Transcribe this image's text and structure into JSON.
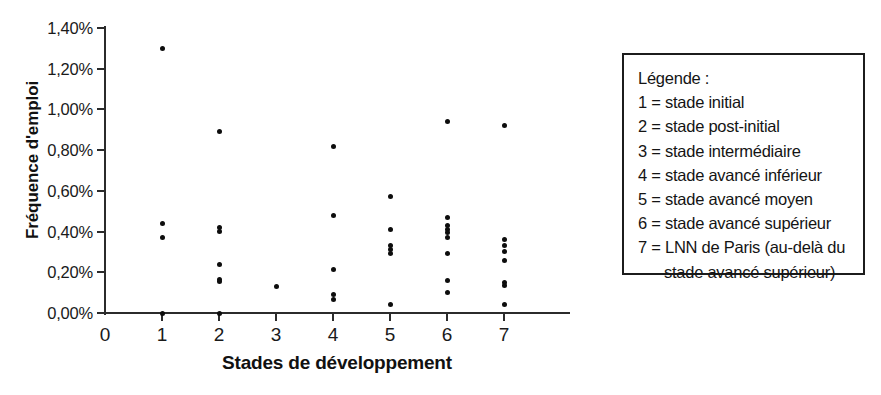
{
  "chart_data": {
    "type": "scatter",
    "title": "",
    "xlabel": "Stades de développement",
    "ylabel": "Fréquence d'emploi",
    "xlim": [
      0,
      8
    ],
    "ylim": [
      0,
      1.4
    ],
    "grid": false,
    "legend_position": "right",
    "x_tick_labels": [
      "0",
      "1",
      "2",
      "3",
      "4",
      "5",
      "6",
      "7"
    ],
    "x_tick_values": [
      0,
      1,
      2,
      3,
      4,
      5,
      6,
      7
    ],
    "y_tick_labels": [
      "0,00%",
      "0,20%",
      "0,40%",
      "0,60%",
      "0,80%",
      "1,00%",
      "1,20%",
      "1,40%"
    ],
    "y_tick_values": [
      0.0,
      0.2,
      0.4,
      0.6,
      0.8,
      1.0,
      1.2,
      1.4
    ],
    "y_unit": "%",
    "decimal_separator": ",",
    "marker_color": "#0d0d0d",
    "points": [
      {
        "x": 1,
        "y": 1.3
      },
      {
        "x": 1,
        "y": 0.44
      },
      {
        "x": 1,
        "y": 0.37
      },
      {
        "x": 1,
        "y": 0.0
      },
      {
        "x": 2,
        "y": 0.89
      },
      {
        "x": 2,
        "y": 0.42
      },
      {
        "x": 2,
        "y": 0.4
      },
      {
        "x": 2,
        "y": 0.24
      },
      {
        "x": 2,
        "y": 0.165
      },
      {
        "x": 2,
        "y": 0.155
      },
      {
        "x": 2,
        "y": 0.0
      },
      {
        "x": 3,
        "y": 0.13
      },
      {
        "x": 4,
        "y": 0.82
      },
      {
        "x": 4,
        "y": 0.48
      },
      {
        "x": 4,
        "y": 0.215
      },
      {
        "x": 4,
        "y": 0.09
      },
      {
        "x": 4,
        "y": 0.065
      },
      {
        "x": 5,
        "y": 0.57
      },
      {
        "x": 5,
        "y": 0.41
      },
      {
        "x": 5,
        "y": 0.33
      },
      {
        "x": 5,
        "y": 0.31
      },
      {
        "x": 5,
        "y": 0.29
      },
      {
        "x": 5,
        "y": 0.04
      },
      {
        "x": 6,
        "y": 0.94
      },
      {
        "x": 6,
        "y": 0.47
      },
      {
        "x": 6,
        "y": 0.43
      },
      {
        "x": 6,
        "y": 0.41
      },
      {
        "x": 6,
        "y": 0.395
      },
      {
        "x": 6,
        "y": 0.37
      },
      {
        "x": 6,
        "y": 0.29
      },
      {
        "x": 6,
        "y": 0.16
      },
      {
        "x": 6,
        "y": 0.1
      },
      {
        "x": 7,
        "y": 0.92
      },
      {
        "x": 7,
        "y": 0.36
      },
      {
        "x": 7,
        "y": 0.33
      },
      {
        "x": 7,
        "y": 0.3
      },
      {
        "x": 7,
        "y": 0.26
      },
      {
        "x": 7,
        "y": 0.15
      },
      {
        "x": 7,
        "y": 0.135
      },
      {
        "x": 7,
        "y": 0.04
      }
    ]
  },
  "legend": {
    "title": "Légende :",
    "entries": [
      "1 = stade initial",
      "2 = stade post-initial",
      "3 = stade intermédiaire",
      "4 = stade avancé inférieur",
      "5 = stade avancé moyen",
      "6 = stade avancé supérieur",
      "7 = LNN de Paris (au-delà du",
      "stade avancé supérieur)"
    ]
  }
}
